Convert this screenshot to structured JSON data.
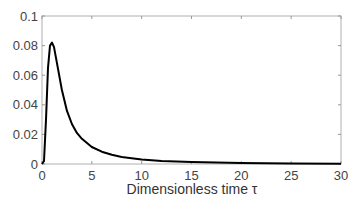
{
  "chart_data": {
    "type": "line",
    "title": "",
    "xlabel": "Dimensionless time τ",
    "ylabel": "",
    "xlim": [
      0,
      30
    ],
    "ylim": [
      0,
      0.1
    ],
    "xticks": [
      0,
      5,
      10,
      15,
      20,
      25,
      30
    ],
    "yticks": [
      0,
      0.02,
      0.04,
      0.06,
      0.08,
      0.1
    ],
    "xtick_labels": [
      "0",
      "5",
      "10",
      "15",
      "20",
      "25",
      "30"
    ],
    "ytick_labels": [
      "0",
      "0.02",
      "0.04",
      "0.06",
      "0.08",
      "0.1"
    ],
    "grid": false,
    "legend": null,
    "series": [
      {
        "name": "curve",
        "color": "#000000",
        "x": [
          0,
          0.2,
          0.4,
          0.6,
          0.8,
          1.0,
          1.2,
          1.5,
          2.0,
          2.5,
          3.0,
          3.5,
          4.0,
          5.0,
          6.0,
          7.0,
          8.0,
          10.0,
          12.0,
          15.0,
          20.0,
          25.0,
          30.0
        ],
        "y": [
          0,
          0.002,
          0.03,
          0.065,
          0.08,
          0.082,
          0.079,
          0.068,
          0.05,
          0.036,
          0.027,
          0.021,
          0.017,
          0.0115,
          0.0083,
          0.0062,
          0.0048,
          0.0031,
          0.0021,
          0.0013,
          0.0006,
          0.0003,
          0.0002
        ]
      }
    ]
  }
}
